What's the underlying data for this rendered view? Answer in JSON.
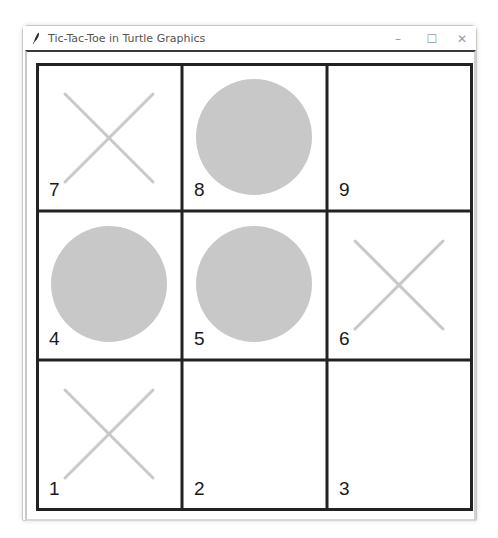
{
  "window": {
    "title": "Tic-Tac-Toe in Turtle Graphics",
    "icon": "feather-icon",
    "controls": {
      "minimize": "–",
      "maximize": "☐",
      "close": "✕"
    }
  },
  "colors": {
    "grid_line": "#222222",
    "mark": "#c8c8c8",
    "number": "#1a1a1a",
    "background": "#ffffff"
  },
  "board": {
    "cells": [
      {
        "number": "7",
        "mark": "X",
        "row": 0,
        "col": 0
      },
      {
        "number": "8",
        "mark": "O",
        "row": 0,
        "col": 1
      },
      {
        "number": "9",
        "mark": "",
        "row": 0,
        "col": 2
      },
      {
        "number": "4",
        "mark": "O",
        "row": 1,
        "col": 0
      },
      {
        "number": "5",
        "mark": "O",
        "row": 1,
        "col": 1
      },
      {
        "number": "6",
        "mark": "X",
        "row": 1,
        "col": 2
      },
      {
        "number": "1",
        "mark": "X",
        "row": 2,
        "col": 0
      },
      {
        "number": "2",
        "mark": "",
        "row": 2,
        "col": 1
      },
      {
        "number": "3",
        "mark": "",
        "row": 2,
        "col": 2
      }
    ]
  }
}
